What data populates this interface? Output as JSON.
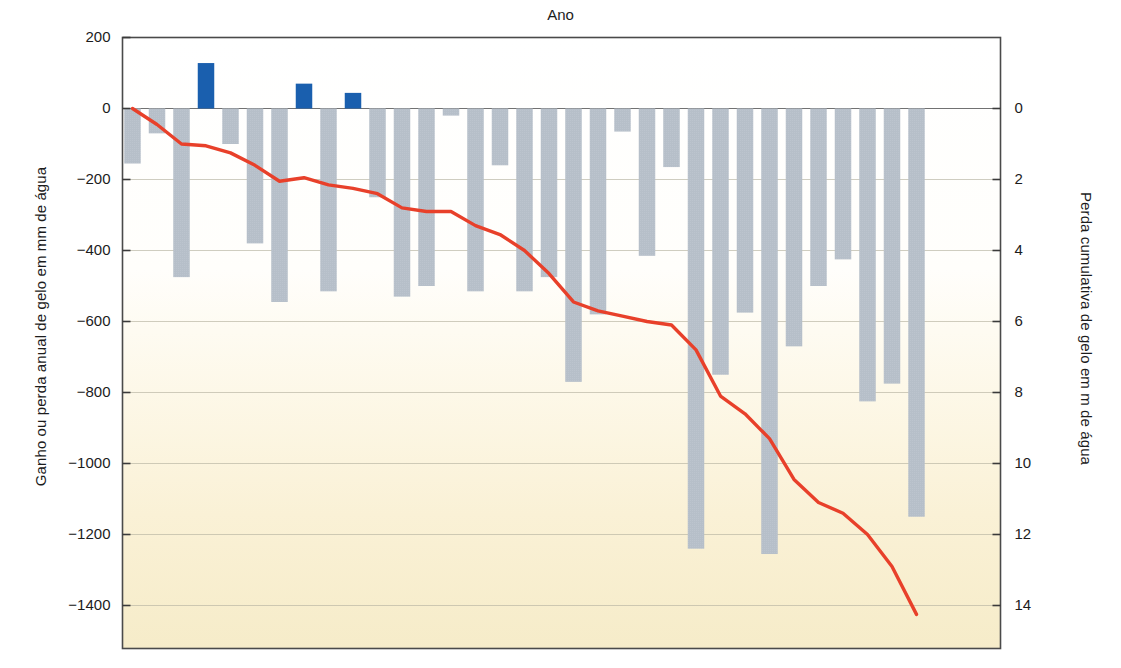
{
  "chart_data": {
    "type": "bar",
    "title": "Ano",
    "xlabel": "Ano",
    "ylabel": "Ganho ou perda anual de gelo em mm de água",
    "ylabel_right": "Perda cumulativa de gelo em m de água",
    "grid": true,
    "legend": "none",
    "ylim": [
      -1480,
      200
    ],
    "ylim_right": [
      14.8,
      -2.0
    ],
    "xlim": [
      1979.5,
      2012.5
    ],
    "yticks": [
      200,
      0,
      -200,
      -400,
      -600,
      -800,
      -1000,
      -1200,
      -1400
    ],
    "ytick_labels": [
      "200",
      "0",
      "-200",
      "-400",
      "-600",
      "-800",
      "-1000",
      "-1200",
      "-1400"
    ],
    "yticks_right": [
      0,
      2,
      4,
      6,
      8,
      10,
      12,
      14
    ],
    "ytick_labels_right": [
      "0",
      "2",
      "4",
      "6",
      "8",
      "10",
      "12",
      "14"
    ],
    "xticks": [
      1980,
      1985,
      1990,
      1995,
      2000,
      2005,
      2010
    ],
    "xtick_labels": [
      "1980",
      "1985",
      "1990",
      "1995",
      "2000",
      "2005",
      "2010"
    ],
    "bar_color_negative": "#b6bfc9",
    "bar_color_positive": "#1a5fae",
    "line_color": "#e8402a",
    "categories": [
      1980,
      1981,
      1982,
      1983,
      1984,
      1985,
      1986,
      1987,
      1988,
      1989,
      1990,
      1991,
      1992,
      1993,
      1994,
      1995,
      1996,
      1997,
      1998,
      1999,
      2000,
      2001,
      2002,
      2003,
      2004,
      2005,
      2006,
      2007,
      2008,
      2009,
      2010,
      2011,
      2012
    ],
    "series": [
      {
        "name": "Ganho ou perda anual de gelo (mm de água)",
        "axis": "left",
        "type": "bar",
        "values": [
          -155,
          -70,
          -475,
          128,
          -100,
          -380,
          -545,
          70,
          -515,
          44,
          -250,
          -530,
          -500,
          -20,
          -515,
          -160,
          -515,
          -475,
          -770,
          -580,
          -65,
          -415,
          -165,
          -1240,
          -750,
          -575,
          -1255,
          -670,
          -500,
          -425,
          -825,
          -775,
          -1150
        ]
      },
      {
        "name": "Perda cumulativa de gelo (m de água)",
        "axis": "right",
        "type": "line",
        "values_mm": [
          0,
          -45,
          -100,
          -105,
          -125,
          -160,
          -205,
          -195,
          -215,
          -225,
          -240,
          -280,
          -290,
          -290,
          -330,
          -355,
          -400,
          -465,
          -545,
          -570,
          -585,
          -600,
          -610,
          -680,
          -810,
          -860,
          -930,
          -1045,
          -1110,
          -1140,
          -1200,
          -1290,
          -1425
        ],
        "values_m": [
          0.0,
          0.45,
          1.0,
          1.05,
          1.25,
          1.6,
          2.05,
          1.95,
          2.15,
          2.25,
          2.4,
          2.8,
          2.9,
          2.9,
          3.3,
          3.55,
          4.0,
          4.65,
          5.45,
          5.7,
          5.85,
          6.0,
          6.1,
          6.8,
          8.1,
          8.6,
          9.3,
          10.45,
          11.1,
          11.4,
          12.0,
          12.9,
          14.25
        ]
      }
    ]
  },
  "style": {
    "plot_bg_top": "#ffffff",
    "plot_bg_bottom": "#f7edcd",
    "frame_color": "#4a4a4a",
    "grid_color": "#b9b5a4"
  }
}
